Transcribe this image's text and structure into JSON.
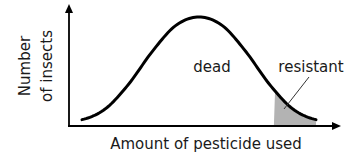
{
  "chart_data": {
    "type": "area",
    "title": "",
    "xlabel": "Amount of pesticide used",
    "ylabel_lines": [
      "Number",
      "of insects"
    ],
    "ylabel": "Number of insects",
    "x_ticks": [],
    "y_ticks": [],
    "grid": false,
    "legend": "none",
    "xlim": [
      0,
      1
    ],
    "ylim": [
      0,
      1
    ],
    "series": [
      {
        "name": "insect distribution",
        "shape": "bell curve",
        "x": [
          0.0,
          0.1,
          0.2,
          0.3,
          0.4,
          0.5,
          0.6,
          0.7,
          0.8,
          0.9,
          1.0
        ],
        "values": [
          0.05,
          0.15,
          0.38,
          0.68,
          0.92,
          1.0,
          0.92,
          0.68,
          0.38,
          0.15,
          0.05
        ],
        "color": "#000000"
      }
    ],
    "regions": [
      {
        "name": "dead",
        "label": "dead",
        "x_range": [
          0.0,
          0.82
        ],
        "fill": "none"
      },
      {
        "name": "resistant",
        "label": "resistant",
        "x_range": [
          0.82,
          1.0
        ],
        "fill": "#b3b3b3"
      }
    ],
    "annotations": [
      {
        "text": "dead",
        "target": "area under curve"
      },
      {
        "text": "resistant",
        "target": "shaded tail",
        "pointer": true
      }
    ]
  }
}
